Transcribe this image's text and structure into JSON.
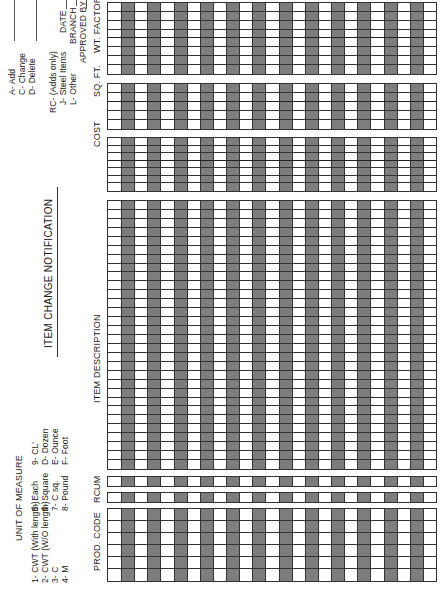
{
  "form": {
    "title": "ITEM CHANGE NOTIFICATION",
    "unit_of_measure": {
      "heading": "UNIT OF MEASURE",
      "col1": [
        "1- CWT (With length)",
        "2- CWT (W/O length)",
        "3- C",
        "4- M"
      ],
      "col2": [
        "5- Each",
        "6- Square",
        "7- C sq.",
        "8- Pound"
      ],
      "col3": [
        "9- CL'",
        "D- Dozen",
        "E- Ounce",
        "F- Foot"
      ]
    },
    "action_codes": [
      "A- Add",
      "C- Change",
      "D- Delete"
    ],
    "rc_codes": {
      "heading": "RC- (Adds only)",
      "items": [
        "J- Steel Items",
        "L- Other"
      ]
    },
    "signoff": {
      "date_label": "DATE",
      "branch_label": "BRANCH",
      "approved_label": "APPROVED BY"
    },
    "columns": {
      "prod_code": "PROD. CODE",
      "rc": "RC",
      "um": "UM",
      "item_description": "ITEM DESCRIPTION",
      "cost": "COST",
      "sq_ft": "SQ. FT.",
      "wt_factor": "WT. FACTOR"
    },
    "row_count": 25,
    "shade_color": "#7d7d7d"
  }
}
